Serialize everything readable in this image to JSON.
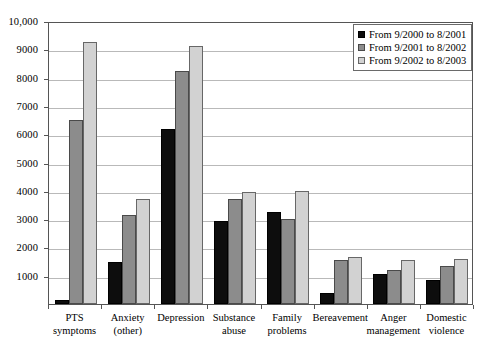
{
  "chart_data": {
    "type": "bar",
    "title": "",
    "subtitle": "",
    "xlabel": "",
    "ylabel": "",
    "ylim": [
      0,
      10000
    ],
    "ytick_values": [
      0,
      1000,
      2000,
      3000,
      4000,
      5000,
      6000,
      7000,
      8000,
      9000,
      10000
    ],
    "ytick_labels": [
      "",
      "1000",
      "2000",
      "3000",
      "4000",
      "5000",
      "6000",
      "7000",
      "8000",
      "9000",
      "10,000"
    ],
    "grid": "horizontal",
    "legend_position": "top-right",
    "categories": [
      "PTS symptoms",
      "Anxiety (other)",
      "Depression",
      "Substance abuse",
      "Family problems",
      "Bereavement",
      "Anger management",
      "Domestic violence"
    ],
    "category_lines": [
      [
        "PTS",
        "symptoms"
      ],
      [
        "Anxiety",
        "(other)"
      ],
      [
        "Depression"
      ],
      [
        "Substance",
        "abuse"
      ],
      [
        "Family",
        "problems"
      ],
      [
        "Bereavement"
      ],
      [
        "Anger",
        "management"
      ],
      [
        "Domestic",
        "violence"
      ]
    ],
    "series": [
      {
        "name": "From 9/2000 to 8/2001",
        "color": "#0d0d0d",
        "values": [
          150,
          1500,
          6200,
          2950,
          3250,
          400,
          1050,
          850
        ]
      },
      {
        "name": "From 9/2001 to 8/2002",
        "color": "#8c8c8c",
        "values": [
          6500,
          3150,
          8250,
          3700,
          3000,
          1550,
          1200,
          1350
        ]
      },
      {
        "name": "From 9/2002 to 8/2003",
        "color": "#d2d2d2",
        "values": [
          9250,
          3700,
          9100,
          3950,
          4000,
          1650,
          1550,
          1600
        ]
      }
    ]
  }
}
